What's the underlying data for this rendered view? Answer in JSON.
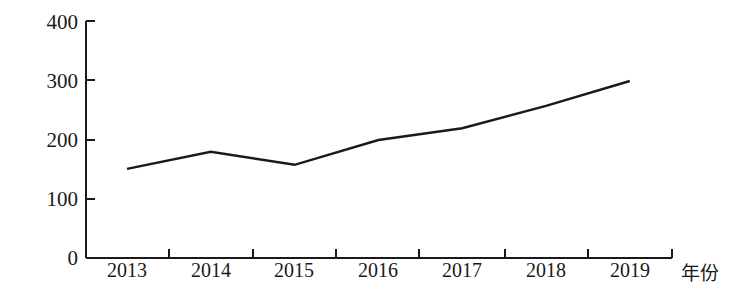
{
  "chart_data": {
    "type": "line",
    "title": "",
    "xlabel": "年份",
    "ylabel": "进口总量（万吨）",
    "categories": [
      "2013",
      "2014",
      "2015",
      "2016",
      "2017",
      "2018",
      "2019"
    ],
    "values": [
      151,
      180,
      158,
      200,
      220,
      258,
      300
    ],
    "series": [
      {
        "name": "进口总量",
        "values": [
          151,
          180,
          158,
          200,
          220,
          258,
          300
        ],
        "color": "#1a1a1a"
      }
    ],
    "ylim": [
      0,
      400
    ],
    "yticks": [
      0,
      100,
      200,
      300,
      400
    ],
    "ytick_labels": [
      "0",
      "100",
      "200",
      "300",
      "400"
    ],
    "xtick_labels": [
      "2013",
      "2014",
      "2015",
      "2016",
      "2017",
      "2018",
      "2019"
    ],
    "grid": false,
    "legend": false,
    "legend_position": "none",
    "line_color": "#1a1a1a",
    "axis_color": "#1a1a1a",
    "background_color": "#ffffff",
    "markers": false
  },
  "axes": {
    "y_title": "进口总量（万吨）",
    "x_title": "年份",
    "y_labels": [
      "400",
      "300",
      "200",
      "100",
      "0"
    ],
    "x_labels": [
      "2013",
      "2014",
      "2015",
      "2016",
      "2017",
      "2018",
      "2019"
    ]
  }
}
